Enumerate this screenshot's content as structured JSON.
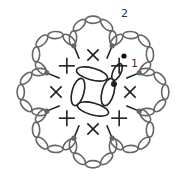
{
  "diagram": {
    "type": "crochet-chart",
    "center": [
      93,
      92
    ],
    "round_labels": [
      {
        "text": "2",
        "x": 121,
        "y": 8
      },
      {
        "text": "1",
        "x": 131,
        "y": 58
      }
    ],
    "start_marker": {
      "x": 124,
      "y": 56,
      "color": "#111111"
    },
    "petal_count": 8,
    "petal_chains_per_loop": 5,
    "sc_count": 8,
    "colors": {
      "round1": "#222222",
      "round2": "#666666",
      "join_dots": "#666666"
    }
  }
}
